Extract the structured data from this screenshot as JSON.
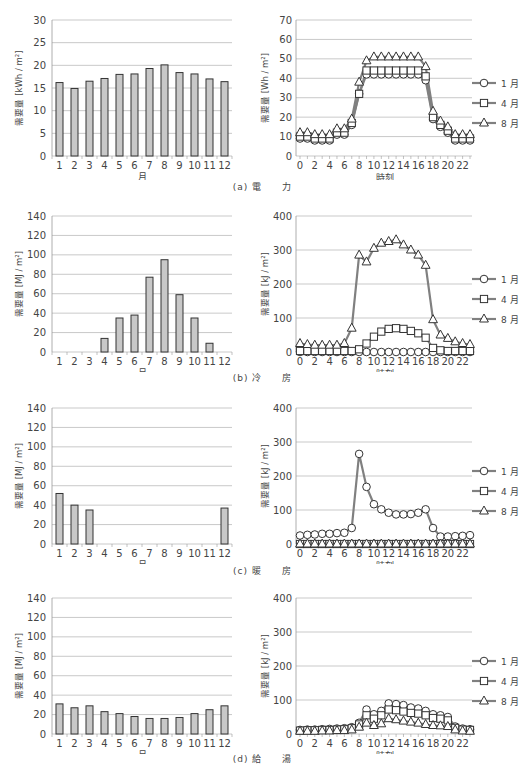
{
  "figures": [
    {
      "id": "a",
      "caption": "(a)  電　　力",
      "bar_ylabel": "需要量 [kWh / m²]",
      "line_ylabel": "需要量 [Wh / m²]"
    },
    {
      "id": "b",
      "caption": "(b)  冷　　房",
      "bar_ylabel": "需要量 [MJ / m²]",
      "line_ylabel": "需要量 [kJ / m²]"
    },
    {
      "id": "c",
      "caption": "(c)  暖　　房",
      "bar_ylabel": "需要量 [MJ / m²]",
      "line_ylabel": "需要量 [kJ / m²]"
    },
    {
      "id": "d",
      "caption": "(d)  給　　湯",
      "bar_ylabel": "需要量 [MJ / m²]",
      "line_ylabel": "需要量 [kJ / m²]"
    }
  ],
  "legend": [
    "1 月",
    "4 月",
    "8 月"
  ],
  "colors": {
    "bar_fill": "#c8c8c8",
    "bar_stroke": "#333333",
    "line": "#808080",
    "grid": "#bbbbbb",
    "text": "#444444"
  },
  "chart_data": [
    {
      "type": "bar",
      "title": "(a) 電力 月別",
      "xlabel": "月",
      "ylabel": "需要量 [kWh / m²]",
      "ylim": [
        0,
        30
      ],
      "yticks": [
        0,
        5,
        10,
        15,
        20,
        25,
        30
      ],
      "grid": true,
      "categories": [
        "1",
        "2",
        "3",
        "4",
        "5",
        "6",
        "7",
        "8",
        "9",
        "10",
        "11",
        "12"
      ],
      "values": [
        16.2,
        14.9,
        16.5,
        17.1,
        18.0,
        18.1,
        19.3,
        20.1,
        18.4,
        18.1,
        17.0,
        16.4
      ]
    },
    {
      "type": "line",
      "title": "(a) 電力 時刻別",
      "xlabel": "時刻",
      "ylabel": "需要量 [Wh / m²]",
      "ylim": [
        0,
        70
      ],
      "yticks": [
        0,
        10,
        20,
        30,
        40,
        50,
        60,
        70
      ],
      "grid": true,
      "legend_position": "right",
      "x": [
        0,
        1,
        2,
        3,
        4,
        5,
        6,
        7,
        8,
        9,
        10,
        11,
        12,
        13,
        14,
        15,
        16,
        17,
        18,
        19,
        20,
        21,
        22,
        23
      ],
      "xticks": [
        0,
        2,
        4,
        6,
        8,
        10,
        12,
        14,
        16,
        18,
        20,
        22
      ],
      "series": [
        {
          "name": "1 月",
          "marker": "circle",
          "values": [
            9,
            9,
            8,
            8,
            8,
            11,
            11,
            16,
            32,
            42,
            42,
            42,
            42,
            42,
            42,
            42,
            42,
            39,
            19,
            15,
            12,
            8,
            8,
            8
          ]
        },
        {
          "name": "4 月",
          "marker": "square",
          "values": [
            10,
            10,
            9,
            9,
            9,
            12,
            12,
            17,
            32,
            44,
            44,
            44,
            44,
            44,
            44,
            44,
            44,
            41,
            20,
            16,
            13,
            9,
            9,
            9
          ]
        },
        {
          "name": "8 月",
          "marker": "triangle",
          "values": [
            12,
            12,
            11,
            11,
            11,
            14,
            14,
            19,
            38,
            49,
            51,
            51,
            51,
            51,
            51,
            51,
            51,
            46,
            23,
            18,
            15,
            11,
            11,
            11
          ]
        }
      ]
    },
    {
      "type": "bar",
      "title": "(b) 冷房 月別",
      "xlabel": "月",
      "ylabel": "需要量 [MJ / m²]",
      "ylim": [
        0,
        140
      ],
      "yticks": [
        0,
        20,
        40,
        60,
        80,
        100,
        120,
        140
      ],
      "grid": true,
      "categories": [
        "1",
        "2",
        "3",
        "4",
        "5",
        "6",
        "7",
        "8",
        "9",
        "10",
        "11",
        "12"
      ],
      "values": [
        0,
        0,
        0,
        14,
        35,
        38,
        77,
        95,
        59,
        35,
        9,
        0
      ]
    },
    {
      "type": "line",
      "title": "(b) 冷房 時刻別",
      "xlabel": "時刻",
      "ylabel": "需要量 [kJ / m²]",
      "ylim": [
        0,
        400
      ],
      "yticks": [
        0,
        100,
        200,
        300,
        400
      ],
      "grid": true,
      "legend_position": "right",
      "x": [
        0,
        1,
        2,
        3,
        4,
        5,
        6,
        7,
        8,
        9,
        10,
        11,
        12,
        13,
        14,
        15,
        16,
        17,
        18,
        19,
        20,
        21,
        22,
        23
      ],
      "xticks": [
        0,
        2,
        4,
        6,
        8,
        10,
        12,
        14,
        16,
        18,
        20,
        22
      ],
      "series": [
        {
          "name": "1 月",
          "marker": "circle",
          "values": [
            0,
            0,
            0,
            0,
            0,
            0,
            0,
            0,
            0,
            0,
            0,
            0,
            0,
            0,
            0,
            0,
            0,
            0,
            0,
            0,
            0,
            0,
            0,
            0
          ]
        },
        {
          "name": "4 月",
          "marker": "square",
          "values": [
            3,
            3,
            3,
            3,
            3,
            3,
            3,
            3,
            8,
            25,
            45,
            60,
            68,
            70,
            68,
            62,
            55,
            42,
            12,
            5,
            3,
            3,
            3,
            3
          ]
        },
        {
          "name": "8 月",
          "marker": "triangle",
          "values": [
            25,
            22,
            20,
            20,
            20,
            20,
            25,
            70,
            285,
            265,
            305,
            320,
            325,
            330,
            315,
            300,
            285,
            255,
            95,
            50,
            40,
            30,
            25,
            22
          ]
        }
      ]
    },
    {
      "type": "bar",
      "title": "(c) 暖房 月別",
      "xlabel": "月",
      "ylabel": "需要量 [MJ / m²]",
      "ylim": [
        0,
        140
      ],
      "yticks": [
        0,
        20,
        40,
        60,
        80,
        100,
        120,
        140
      ],
      "grid": true,
      "categories": [
        "1",
        "2",
        "3",
        "4",
        "5",
        "6",
        "7",
        "8",
        "9",
        "10",
        "11",
        "12"
      ],
      "values": [
        52,
        40,
        35,
        0,
        0,
        0,
        0,
        0,
        0,
        0,
        0,
        37
      ]
    },
    {
      "type": "line",
      "title": "(c) 暖房 時刻別",
      "xlabel": "時刻",
      "ylabel": "需要量 [kJ / m²]",
      "ylim": [
        0,
        400
      ],
      "yticks": [
        0,
        100,
        200,
        300,
        400
      ],
      "grid": true,
      "legend_position": "right",
      "x": [
        0,
        1,
        2,
        3,
        4,
        5,
        6,
        7,
        8,
        9,
        10,
        11,
        12,
        13,
        14,
        15,
        16,
        17,
        18,
        19,
        20,
        21,
        22,
        23
      ],
      "xticks": [
        0,
        2,
        4,
        6,
        8,
        10,
        12,
        14,
        16,
        18,
        20,
        22
      ],
      "series": [
        {
          "name": "1 月",
          "marker": "circle",
          "values": [
            25,
            27,
            28,
            30,
            30,
            32,
            33,
            47,
            265,
            168,
            117,
            102,
            92,
            87,
            87,
            88,
            92,
            102,
            47,
            22,
            22,
            23,
            24,
            26
          ]
        },
        {
          "name": "4 月",
          "marker": "square",
          "values": [
            0,
            0,
            0,
            0,
            0,
            0,
            0,
            0,
            0,
            0,
            0,
            0,
            0,
            0,
            0,
            0,
            0,
            0,
            0,
            0,
            0,
            0,
            0,
            0
          ]
        },
        {
          "name": "8 月",
          "marker": "triangle",
          "values": [
            0,
            0,
            0,
            0,
            0,
            0,
            0,
            0,
            0,
            0,
            0,
            0,
            0,
            0,
            0,
            0,
            0,
            0,
            0,
            0,
            0,
            0,
            0,
            0
          ]
        }
      ]
    },
    {
      "type": "bar",
      "title": "(d) 給湯 月別",
      "xlabel": "月",
      "ylabel": "需要量 [MJ / m²]",
      "ylim": [
        0,
        140
      ],
      "yticks": [
        0,
        20,
        40,
        60,
        80,
        100,
        120,
        140
      ],
      "grid": true,
      "categories": [
        "1",
        "2",
        "3",
        "4",
        "5",
        "6",
        "7",
        "8",
        "9",
        "10",
        "11",
        "12"
      ],
      "values": [
        31,
        27,
        29,
        23,
        21,
        18,
        16,
        16,
        17,
        21,
        25,
        29
      ]
    },
    {
      "type": "line",
      "title": "(d) 給湯 時刻別",
      "xlabel": "時刻",
      "ylabel": "需要量 [kJ / m²]",
      "ylim": [
        0,
        400
      ],
      "yticks": [
        0,
        100,
        200,
        300,
        400
      ],
      "grid": true,
      "legend_position": "right",
      "x": [
        0,
        1,
        2,
        3,
        4,
        5,
        6,
        7,
        8,
        9,
        10,
        11,
        12,
        13,
        14,
        15,
        16,
        17,
        18,
        19,
        20,
        21,
        22,
        23
      ],
      "xticks": [
        0,
        2,
        4,
        6,
        8,
        10,
        12,
        14,
        16,
        18,
        20,
        22
      ],
      "series": [
        {
          "name": "1 月",
          "marker": "circle",
          "values": [
            12,
            13,
            13,
            14,
            15,
            16,
            17,
            20,
            33,
            72,
            58,
            68,
            90,
            88,
            85,
            78,
            75,
            68,
            58,
            55,
            50,
            22,
            16,
            14
          ]
        },
        {
          "name": "4 月",
          "marker": "square",
          "values": [
            10,
            11,
            11,
            12,
            12,
            13,
            14,
            17,
            28,
            55,
            45,
            55,
            72,
            70,
            66,
            62,
            60,
            55,
            47,
            45,
            40,
            18,
            13,
            12
          ]
        },
        {
          "name": "8 月",
          "marker": "triangle",
          "values": [
            8,
            8,
            8,
            9,
            9,
            10,
            10,
            12,
            20,
            32,
            25,
            30,
            45,
            42,
            38,
            35,
            32,
            28,
            25,
            24,
            22,
            12,
            9,
            8
          ]
        }
      ]
    }
  ]
}
